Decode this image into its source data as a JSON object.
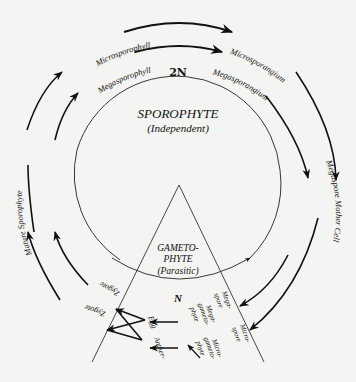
{
  "diagram": {
    "title_sporophyte": "SPOROPHYTE",
    "sub_sporophyte": "(Independent)",
    "ploidy_top": "2N",
    "ploidy_bottom": "N",
    "gametophyte_line1": "GAMETO-",
    "gametophyte_line2": "PHYTE",
    "gametophyte_sub": "(Parasitic)",
    "outer_cycle": {
      "labels": [
        "Microsporophyll",
        "Microsporangium",
        "Microspore Mother Cell",
        "Microspore",
        "Microgametophyte",
        "Antheroid",
        "Zygote",
        "Mature Sporophyte"
      ]
    },
    "inner_cycle": {
      "labels": [
        "Megasporophyll",
        "Megasporangium",
        "Megaspore Mother Cell",
        "Megaspore",
        "Megagametophyte",
        "Egg",
        "Zygote",
        "Mature Sporophyte"
      ]
    },
    "small_labels": {
      "mega_spore": [
        "Mega-",
        "spore"
      ],
      "micro_spore": [
        "Micro-",
        "spore"
      ],
      "mega_gameto": [
        "Mega-",
        "gameto-",
        "phyte"
      ],
      "micro_gameto": [
        "Micro-",
        "gameto-",
        "phyte"
      ],
      "egg": "Egg",
      "antheroid": [
        "Anther-",
        "oroid"
      ]
    },
    "colors": {
      "ink": "#111111",
      "paper": "#f4f4f2"
    }
  }
}
